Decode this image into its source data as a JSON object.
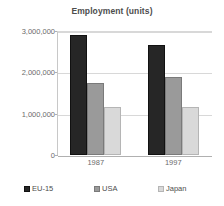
{
  "chart_data": {
    "type": "bar",
    "title": "Employment (units)",
    "xlabel": "",
    "ylabel": "",
    "categories": [
      "1987",
      "1997"
    ],
    "series": [
      {
        "name": "EU-15",
        "color": "#262626",
        "values": [
          2900000,
          2650000
        ]
      },
      {
        "name": "USA",
        "color": "#9a9a9a",
        "values": [
          1750000,
          1880000
        ]
      },
      {
        "name": "Japan",
        "color": "#d9d9d9",
        "values": [
          1150000,
          1150000
        ]
      }
    ],
    "ylim": [
      0,
      3000000
    ],
    "yticks": [
      0,
      1000000,
      2000000,
      3000000
    ],
    "ytick_labels": [
      "0",
      "1,000,000",
      "2,000,000",
      "3,000,000"
    ],
    "grid": true,
    "legend_position": "bottom"
  }
}
